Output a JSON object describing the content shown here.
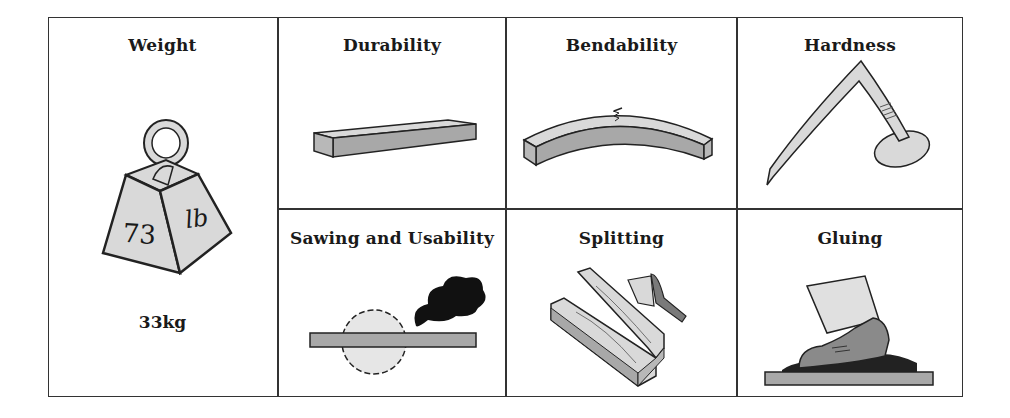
{
  "diagram": {
    "cells": [
      {
        "id": "weight",
        "title": "Weight",
        "icon": "weight-icon",
        "weight_front": "73",
        "weight_side": "lb",
        "caption": "33kg"
      },
      {
        "id": "durability",
        "title": "Durability",
        "icon": "wooden-plank-icon"
      },
      {
        "id": "bendability",
        "title": "Bendability",
        "icon": "bent-plank-icon"
      },
      {
        "id": "hardness",
        "title": "Hardness",
        "icon": "bent-nail-icon"
      },
      {
        "id": "sawing",
        "title": "Sawing and Usability",
        "icon": "circular-saw-smoke-icon"
      },
      {
        "id": "splitting",
        "title": "Splitting",
        "icon": "split-log-axe-icon"
      },
      {
        "id": "gluing",
        "title": "Gluing",
        "icon": "shoe-glue-icon"
      }
    ],
    "colors": {
      "border": "#333333",
      "fill_light": "#d9d9d9",
      "fill_mid": "#a8a8a8",
      "fill_dark": "#7a7a7a",
      "ink": "#1a1a1a",
      "smoke": "#111111"
    }
  }
}
